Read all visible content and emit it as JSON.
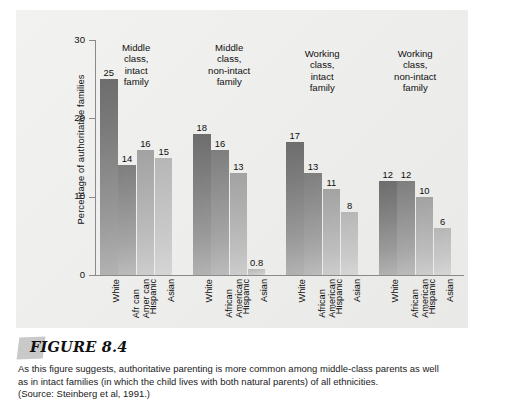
{
  "figure": {
    "label": "FIGURE 8.4",
    "caption_line_1": "As this figure suggests, authoritative parenting is more common among middle-class parents as well",
    "caption_line_2": "as in intact families (in which the child lives with both natural parents) of all ethnicities.",
    "caption_line_3": "(Source: Steinberg et al, 1991.)"
  },
  "chart_data": {
    "type": "bar",
    "title": "",
    "xlabel": "",
    "ylabel": "Percentage of authoritative families",
    "ylim": [
      0,
      30
    ],
    "yticks": [
      0,
      10,
      20,
      30
    ],
    "ytick_labels": [
      "0",
      "10",
      "20",
      "30"
    ],
    "grid": false,
    "legend": "none",
    "categories": [
      "White",
      "African American",
      "Hispanic",
      "Asian"
    ],
    "groups": [
      {
        "heading": "Middle class, intact family",
        "heading_lines": [
          "Middle",
          "class,",
          "intact",
          "family"
        ],
        "bars": [
          {
            "category": "White",
            "category_lines": [
              "White"
            ],
            "value": 25,
            "label": "25"
          },
          {
            "category": "African American",
            "category_lines": [
              "Afr can",
              "Amer can"
            ],
            "value": 14,
            "label": "14"
          },
          {
            "category": "Hispanic",
            "category_lines": [
              "Hispanic"
            ],
            "value": 16,
            "label": "16"
          },
          {
            "category": "Asian",
            "category_lines": [
              "Asian"
            ],
            "value": 15,
            "label": "15"
          }
        ]
      },
      {
        "heading": "Middle class, non-intact family",
        "heading_lines": [
          "Middle",
          "class,",
          "non-intact",
          "family"
        ],
        "bars": [
          {
            "category": "White",
            "category_lines": [
              "White"
            ],
            "value": 18,
            "label": "18"
          },
          {
            "category": "African American",
            "category_lines": [
              "African",
              "American"
            ],
            "value": 16,
            "label": "16"
          },
          {
            "category": "Hispanic",
            "category_lines": [
              "Hispanic"
            ],
            "value": 13,
            "label": "13"
          },
          {
            "category": "Asian",
            "category_lines": [
              "Asian"
            ],
            "value": 0.8,
            "label": "0.8"
          }
        ]
      },
      {
        "heading": "Working class, intact family",
        "heading_lines": [
          "Working",
          "class,",
          "intact",
          "family"
        ],
        "bars": [
          {
            "category": "White",
            "category_lines": [
              "White"
            ],
            "value": 17,
            "label": "17"
          },
          {
            "category": "African American",
            "category_lines": [
              "African",
              "American"
            ],
            "value": 13,
            "label": "13"
          },
          {
            "category": "Hispanic",
            "category_lines": [
              "Hispanic"
            ],
            "value": 11,
            "label": "11"
          },
          {
            "category": "Asian",
            "category_lines": [
              "Asian"
            ],
            "value": 8,
            "label": "8"
          }
        ]
      },
      {
        "heading": "Working class, non-intact family",
        "heading_lines": [
          "Working",
          "class,",
          "non-intact",
          "family"
        ],
        "bars": [
          {
            "category": "White",
            "category_lines": [
              "White"
            ],
            "value": 12,
            "label": "12"
          },
          {
            "category": "African American",
            "category_lines": [
              "African",
              "American"
            ],
            "value": 12,
            "label": "12"
          },
          {
            "category": "Hispanic",
            "category_lines": [
              "Hispanic"
            ],
            "value": 10,
            "label": "10"
          },
          {
            "category": "Asian",
            "category_lines": [
              "Asian"
            ],
            "value": 6,
            "label": "6"
          }
        ]
      }
    ]
  },
  "colors": {
    "panel_background": "#eeeeec",
    "axis": "#8a8a8a",
    "text": "#101010",
    "bar_white": "#7c7c7c",
    "bar_african_american": "#8d8d8d",
    "bar_hispanic": "#adadad",
    "bar_asian": "#bfbfbf",
    "figure_tab": "#c9c9c9"
  }
}
